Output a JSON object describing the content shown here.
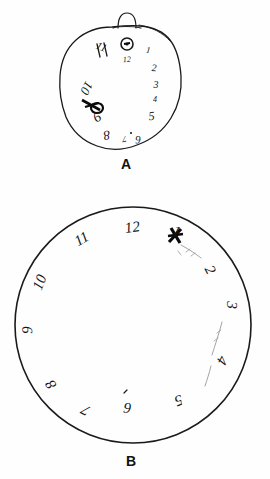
{
  "figure": {
    "background_color": "#fefefe",
    "ink_color": "#1a1a1a",
    "faint_ink_color": "#9a9a9a",
    "panels": [
      {
        "id": "A",
        "label": "A",
        "description": "hand-drawn irregular oval clock face with pocket-watch loop at top, numbers crowded to the right and lower-left",
        "dial_shape": "irregular-oval",
        "has_crown_loop": true,
        "has_center_hub": true,
        "numbers": [
          "12",
          "1",
          "2",
          "3",
          "4",
          "5",
          "6",
          "7",
          "8",
          "9",
          "10",
          "11"
        ]
      },
      {
        "id": "B",
        "label": "B",
        "description": "large clean circle with numbers 1 through 12 written rotated around the inside rim",
        "dial_shape": "circle",
        "has_crown_loop": false,
        "has_center_hub": false,
        "numbers": [
          "12",
          "1",
          "2",
          "3",
          "4",
          "5",
          "6",
          "7",
          "8",
          "9",
          "10",
          "11"
        ]
      }
    ],
    "clock_a": {
      "label": "A",
      "numbers": [
        {
          "text": "12",
          "x": 127,
          "y": 62,
          "size": 8,
          "rotate": -4
        },
        {
          "text": "1",
          "x": 148,
          "y": 53,
          "size": 9,
          "rotate": 6
        },
        {
          "text": "2",
          "x": 154,
          "y": 71,
          "size": 10,
          "rotate": 2
        },
        {
          "text": "3",
          "x": 156,
          "y": 88,
          "size": 10,
          "rotate": 0
        },
        {
          "text": "4",
          "x": 155,
          "y": 102,
          "size": 8,
          "rotate": 0
        },
        {
          "text": "5",
          "x": 152,
          "y": 120,
          "size": 12,
          "rotate": -6
        },
        {
          "text": "6",
          "x": 138,
          "y": 136,
          "size": 11,
          "rotate": 178
        },
        {
          "text": "7",
          "x": 124,
          "y": 136,
          "size": 9,
          "rotate": 172
        },
        {
          "text": "8",
          "x": 106,
          "y": 131,
          "size": 13,
          "rotate": 170
        },
        {
          "text": "9",
          "x": 95,
          "y": 113,
          "size": 14,
          "rotate": 150
        },
        {
          "text": "10",
          "x": 83,
          "y": 86,
          "size": 13,
          "rotate": 118
        },
        {
          "text": "11",
          "x": 100,
          "y": 50,
          "size": 11,
          "rotate": 24
        }
      ]
    },
    "clock_b": {
      "label": "B",
      "numbers": [
        {
          "text": "12",
          "x": 133,
          "y": 232,
          "size": 15,
          "rotate": -8
        },
        {
          "text": "1",
          "x": 175,
          "y": 236,
          "size": 15,
          "rotate": 18
        },
        {
          "text": "2",
          "x": 206,
          "y": 272,
          "size": 15,
          "rotate": 62
        },
        {
          "text": "3",
          "x": 227,
          "y": 305,
          "size": 15,
          "rotate": 92
        },
        {
          "text": "4",
          "x": 218,
          "y": 358,
          "size": 15,
          "rotate": 118
        },
        {
          "text": "5",
          "x": 177,
          "y": 396,
          "size": 15,
          "rotate": 160
        },
        {
          "text": "6",
          "x": 128,
          "y": 403,
          "size": 15,
          "rotate": 186
        },
        {
          "text": "7",
          "x": 88,
          "y": 406,
          "size": 15,
          "rotate": 208
        },
        {
          "text": "8",
          "x": 55,
          "y": 382,
          "size": 15,
          "rotate": 238
        },
        {
          "text": "9",
          "x": 32,
          "y": 330,
          "size": 15,
          "rotate": 268
        },
        {
          "text": "10",
          "x": 44,
          "y": 284,
          "size": 15,
          "rotate": 292
        },
        {
          "text": "11",
          "x": 84,
          "y": 243,
          "size": 15,
          "rotate": 330
        }
      ]
    }
  }
}
